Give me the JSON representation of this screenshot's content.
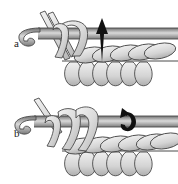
{
  "figure": {
    "type": "instructional-line-drawing",
    "background_color": "#ffffff",
    "panel_count": 2
  },
  "panels": [
    {
      "id": "a",
      "label": "a",
      "description": "Crochet hook held horizontally with yarn loops on shaft; black downward arrow indicates hook insertion point into the stitch row below",
      "arrow": {
        "name": "down-arrow",
        "direction": "down",
        "color": "#111111"
      },
      "elements": {
        "hook": "crochet-hook-pointing-left",
        "loops_on_hook": 2,
        "yarn_strands": 2,
        "base_stitch_row": "row-of-completed-stitches",
        "bottom_loops": 5
      }
    },
    {
      "id": "b",
      "label": "b",
      "description": "Crochet hook with two tall yarn loops drawn up over the shaft; black curved hook-shaped arrow indicates yarn-over direction",
      "arrow": {
        "name": "curved-hook-arrow",
        "direction": "curved-left",
        "color": "#111111"
      },
      "elements": {
        "hook": "crochet-hook-pointing-left",
        "loops_on_hook": 3,
        "yarn_strands": 1,
        "base_stitch_row": "row-of-completed-stitches",
        "bottom_loops": 5
      }
    }
  ],
  "colors": {
    "outline": "#3a3a3a",
    "yarn_fill_light": "#e6e6e6",
    "yarn_fill_mid": "#cfcfcf",
    "yarn_fill_dark": "#a8a8a8",
    "shaft_dark": "#8d8d8d",
    "shaft_light": "#d8d8d8",
    "arrow": "#111111",
    "background": "#ffffff",
    "label_text": "#1a1a1a"
  }
}
